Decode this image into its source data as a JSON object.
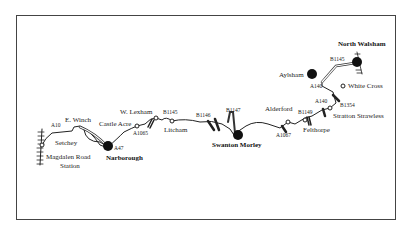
{
  "map": {
    "towns": {
      "north_walsham": "North Walsham",
      "aylsham": "Aylsham",
      "swanton_morley": "Swanton Morley",
      "narborough": "Narborough"
    },
    "places": {
      "white_cross": "White Cross",
      "stratton_strawless": "Stratton Strawless",
      "felthorpe": "Felthorpe",
      "alderford": "Alderford",
      "litcham": "Litcham",
      "w_lexham": "W. Lexham",
      "castle_acre": "Castle Acre",
      "e_winch": "E. Winch",
      "setchey": "Setchey",
      "magdalen_road_station_1": "Magdalen Road",
      "magdalen_road_station_2": "Station"
    },
    "roads": {
      "b1145_north": "B1145",
      "a140_aylsham": "A140",
      "a140_stratton": "A140",
      "b1354": "B1354",
      "b1149": "B1149",
      "a1067": "A1067",
      "b1147": "B1147",
      "b1146": "B1146",
      "b1145_litcham": "B1145",
      "a1065": "A1065",
      "a47": "A47",
      "a10": "A10"
    }
  }
}
